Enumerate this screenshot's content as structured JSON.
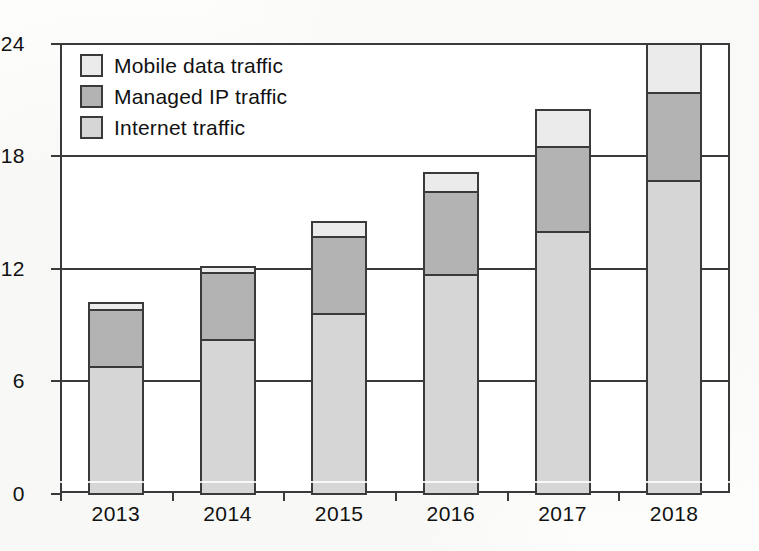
{
  "chart_data": {
    "type": "bar",
    "title": "",
    "subtitle": "",
    "xlabel": "",
    "ylabel": "",
    "stacked": true,
    "grid": true,
    "legend_position": "top-left-inside",
    "categories": [
      "2013",
      "2014",
      "2015",
      "2016",
      "2017",
      "2018"
    ],
    "ylim": [
      0,
      24
    ],
    "yticks": [
      0,
      6,
      12,
      18,
      24
    ],
    "series": [
      {
        "name": "Internet traffic",
        "color": "#d6d6d6",
        "values": [
          6.8,
          8.2,
          9.6,
          11.7,
          14.0,
          16.7
        ]
      },
      {
        "name": "Managed IP traffic",
        "color": "#b3b3b3",
        "values": [
          3.0,
          3.6,
          4.1,
          4.4,
          4.5,
          4.7
        ]
      },
      {
        "name": "Mobile data traffic",
        "color": "#ebebeb",
        "values": [
          0.4,
          0.3,
          0.8,
          1.0,
          2.0,
          2.6
        ]
      }
    ],
    "cumulative_tops": {
      "Internet traffic": [
        6.8,
        8.2,
        9.6,
        11.7,
        14.0,
        16.7
      ],
      "Managed IP traffic": [
        9.8,
        11.8,
        13.7,
        16.1,
        18.5,
        21.4
      ],
      "Mobile data traffic": [
        10.2,
        12.1,
        14.5,
        17.1,
        20.5,
        24.0
      ]
    },
    "totals": [
      10.2,
      12.1,
      14.5,
      17.1,
      20.5,
      24.0
    ]
  },
  "legend": {
    "items": [
      {
        "label": "Mobile data traffic",
        "color": "#ebebeb"
      },
      {
        "label": "Managed IP traffic",
        "color": "#b3b3b3"
      },
      {
        "label": "Internet traffic",
        "color": "#d6d6d6"
      }
    ]
  },
  "axis": {
    "y_tick_labels": [
      "24",
      "18",
      "12",
      "6",
      "0"
    ],
    "x_tick_labels": [
      "2013",
      "2014",
      "2015",
      "2016",
      "2017",
      "2018"
    ]
  },
  "colors": {
    "axis": "#3a3a3a",
    "background": "#fdfdfc",
    "plot_background": "#ffffff"
  }
}
